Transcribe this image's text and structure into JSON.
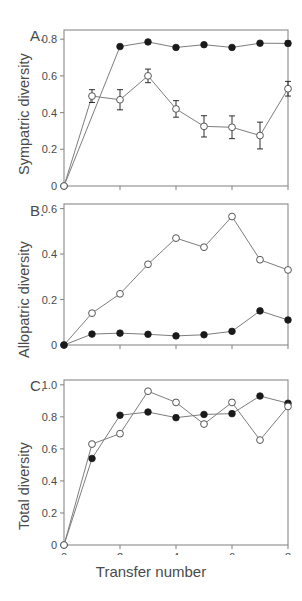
{
  "figure": {
    "xlabel": "Transfer number",
    "caption_partial": ""
  },
  "panels": [
    {
      "label": "A.",
      "ylabel": "Sympatric diversity",
      "yticks": [
        "0",
        "0.2",
        "0.4",
        "0.6",
        "0.8"
      ]
    },
    {
      "label": "B.",
      "ylabel": "Allopatric diversity",
      "yticks": [
        "0",
        "0.2",
        "0.4",
        "0.6"
      ]
    },
    {
      "label": "C.",
      "ylabel": "Total diversity",
      "yticks": [
        "0",
        "0.2",
        "0.4",
        "0.6",
        "0.8",
        "1.0"
      ]
    }
  ],
  "xticks": [
    "0",
    "2",
    "4",
    "6",
    "8"
  ],
  "chart_data": [
    {
      "type": "line",
      "panel": "A",
      "title": "",
      "xlabel": "Transfer number",
      "ylabel": "Sympatric diversity",
      "xlim": [
        0,
        8
      ],
      "ylim": [
        0,
        0.85
      ],
      "yticks": [
        0,
        0.2,
        0.4,
        0.6,
        0.8
      ],
      "xticks": [
        0,
        2,
        4,
        6,
        8
      ],
      "grid": false,
      "legend": "none",
      "series": [
        {
          "name": "filled-circles",
          "marker": "filled-circle",
          "x": [
            0,
            2,
            3,
            4,
            5,
            6,
            7,
            8
          ],
          "values": [
            0.0,
            0.76,
            0.785,
            0.755,
            0.77,
            0.755,
            0.778,
            0.777
          ],
          "errors": [
            0,
            0,
            0,
            0,
            0,
            0,
            0,
            0.012
          ]
        },
        {
          "name": "open-circles",
          "marker": "open-circle",
          "x": [
            0,
            1,
            2,
            3,
            4,
            5,
            6,
            7,
            8
          ],
          "values": [
            0.0,
            0.49,
            0.47,
            0.6,
            0.42,
            0.325,
            0.32,
            0.275,
            0.53
          ],
          "errors": [
            0,
            0.035,
            0.055,
            0.037,
            0.045,
            0.058,
            0.062,
            0.073,
            0.04
          ]
        }
      ]
    },
    {
      "type": "line",
      "panel": "B",
      "title": "",
      "xlabel": "Transfer number",
      "ylabel": "Allopatric diversity",
      "xlim": [
        0,
        8
      ],
      "ylim": [
        0,
        0.62
      ],
      "yticks": [
        0,
        0.2,
        0.4,
        0.6
      ],
      "xticks": [
        0,
        2,
        4,
        6,
        8
      ],
      "grid": false,
      "legend": "none",
      "series": [
        {
          "name": "open-circles",
          "marker": "open-circle",
          "x": [
            0,
            1,
            2,
            3,
            4,
            5,
            6,
            7,
            8
          ],
          "values": [
            0.0,
            0.14,
            0.225,
            0.355,
            0.47,
            0.43,
            0.565,
            0.375,
            0.33
          ]
        },
        {
          "name": "filled-circles",
          "marker": "filled-circle",
          "x": [
            0,
            1,
            2,
            3,
            4,
            5,
            6,
            7,
            8
          ],
          "values": [
            0.0,
            0.048,
            0.052,
            0.047,
            0.04,
            0.045,
            0.06,
            0.15,
            0.11
          ]
        }
      ]
    },
    {
      "type": "line",
      "panel": "C",
      "title": "",
      "xlabel": "Transfer number",
      "ylabel": "Total diversity",
      "xlim": [
        0,
        8
      ],
      "ylim": [
        0,
        1.03
      ],
      "yticks": [
        0,
        0.2,
        0.4,
        0.6,
        0.8,
        1.0
      ],
      "xticks": [
        0,
        2,
        4,
        6,
        8
      ],
      "grid": false,
      "legend": "none",
      "series": [
        {
          "name": "filled-circles",
          "marker": "filled-circle",
          "x": [
            0,
            1,
            2,
            3,
            4,
            5,
            6,
            7,
            8
          ],
          "values": [
            0.0,
            0.54,
            0.81,
            0.83,
            0.795,
            0.815,
            0.82,
            0.93,
            0.885
          ]
        },
        {
          "name": "open-circles",
          "marker": "open-circle",
          "x": [
            0,
            1,
            2,
            3,
            4,
            5,
            6,
            7,
            8
          ],
          "values": [
            0.0,
            0.63,
            0.695,
            0.96,
            0.89,
            0.755,
            0.89,
            0.655,
            0.865
          ]
        }
      ]
    }
  ]
}
